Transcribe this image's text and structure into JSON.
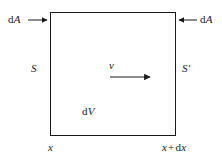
{
  "figure": {
    "kind": "control-volume-diagram",
    "background_color": "#ffffff",
    "line_color": "#1a1a1a",
    "text_color": "#1a1a1a",
    "width_px": 222,
    "height_px": 158
  },
  "box": {
    "name": "control-volume",
    "left_px": 50,
    "top_px": 12,
    "right_px": 176,
    "bottom_px": 136,
    "stroke_width_px": 1
  },
  "labels": {
    "da_left": {
      "d": "d",
      "symbol": "A"
    },
    "da_right": {
      "d": "d",
      "symbol": "A"
    },
    "surface_left": "S",
    "surface_right": "S′",
    "velocity": "v",
    "volume": {
      "d": "d",
      "symbol": "V"
    },
    "x_left": "x",
    "x_right": {
      "x": "x",
      "operator": "+",
      "d": "d",
      "dx_symbol": "x"
    }
  },
  "arrows": {
    "da_left": {
      "name": "da-left-arrow",
      "direction": "right",
      "x1": 28,
      "y1": 20,
      "x2": 49,
      "y2": 20
    },
    "da_right": {
      "name": "da-right-arrow",
      "direction": "left",
      "x1": 197,
      "y1": 20,
      "x2": 177,
      "y2": 20
    },
    "velocity": {
      "name": "velocity-arrow",
      "direction": "right",
      "x1": 110,
      "y1": 77,
      "x2": 152,
      "y2": 77
    }
  }
}
